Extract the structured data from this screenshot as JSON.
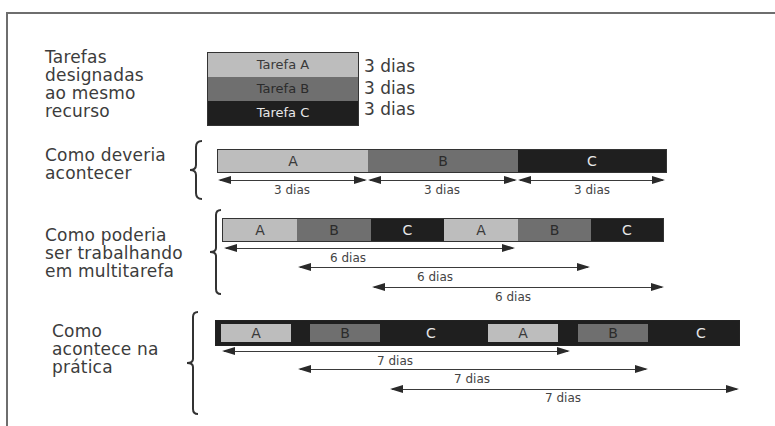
{
  "legend": {
    "title": "Tarefas\ndesignadas\nao mesmo\nrecurso",
    "tasks": [
      {
        "label": "Tarefa A",
        "duration": "3 dias",
        "color": "#bdbdbd"
      },
      {
        "label": "Tarefa B",
        "duration": "3 dias",
        "color": "#6f6f6f"
      },
      {
        "label": "Tarefa C",
        "duration": "3 dias",
        "color": "#1f1f1f"
      }
    ]
  },
  "scenarios": [
    {
      "title": "Como deveria\nacontecer",
      "segments": [
        "A",
        "B",
        "C"
      ],
      "spans": [
        "3 dias",
        "3 dias",
        "3 dias"
      ]
    },
    {
      "title": "Como poderia\nser trabalhando\nem multitarefa",
      "segments": [
        "A",
        "B",
        "C",
        "A",
        "B",
        "C"
      ],
      "spans": [
        "6 dias",
        "6 dias",
        "6 dias"
      ]
    },
    {
      "title": "Como\nacontece na\nprática",
      "segments": [
        "A",
        "B",
        "C",
        "A",
        "B",
        "C"
      ],
      "spans": [
        "7 dias",
        "7 dias",
        "7 dias"
      ]
    }
  ]
}
